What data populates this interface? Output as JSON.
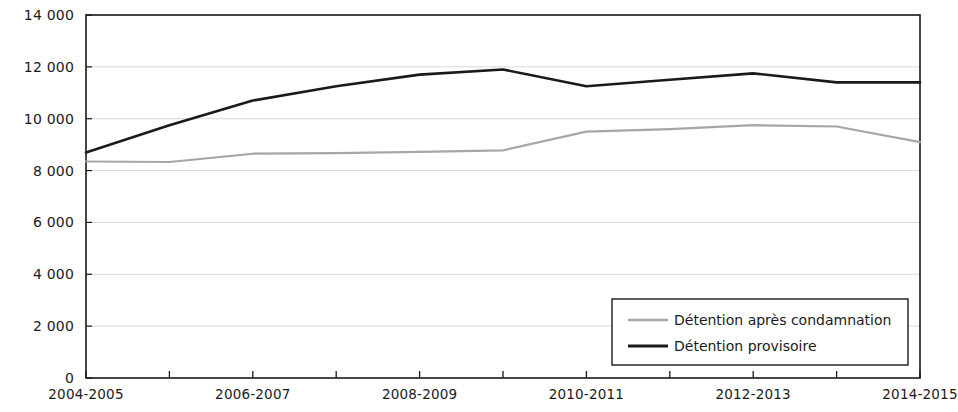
{
  "chart_data": {
    "type": "line",
    "title": "",
    "subtitle": "",
    "xlabel": "",
    "ylabel": "",
    "x": [
      "2004-2005",
      "2005-2006",
      "2006-2007",
      "2007-2008",
      "2008-2009",
      "2009-2010",
      "2010-2011",
      "2011-2012",
      "2012-2013",
      "2013-2014",
      "2014-2015"
    ],
    "categories": [
      "2004-2005",
      "2005-2006",
      "2006-2007",
      "2007-2008",
      "2008-2009",
      "2009-2010",
      "2010-2011",
      "2011-2012",
      "2012-2013",
      "2013-2014",
      "2014-2015"
    ],
    "series": [
      {
        "name": "Détention après condamnation",
        "color": "#a6a6a6",
        "values": [
          8350,
          8330,
          8650,
          8670,
          8720,
          8780,
          9500,
          9600,
          9750,
          9700,
          9100
        ]
      },
      {
        "name": "Détention provisoire",
        "color": "#1a1a1a",
        "values": [
          8700,
          9750,
          10700,
          11250,
          11700,
          11900,
          11250,
          11500,
          11750,
          11400,
          11400
        ]
      }
    ],
    "ylim": [
      0,
      14000
    ],
    "ytick_values": [
      0,
      2000,
      4000,
      6000,
      8000,
      10000,
      12000,
      14000
    ],
    "ytick_labels": [
      "0",
      "2 000",
      "4 000",
      "6 000",
      "8 000",
      "10 000",
      "12 000",
      "14 000"
    ],
    "xtick_labels_visible": [
      "2004-2005",
      "2006-2007",
      "2008-2009",
      "2010-2011",
      "2012-2013",
      "2014-2015"
    ],
    "xtick_label_indices": [
      0,
      2,
      4,
      6,
      8,
      10
    ],
    "grid": true,
    "grid_axis": "y",
    "legend_position": "bottom-right",
    "legend_entries": [
      {
        "label": "Détention après condamnation",
        "color": "#a6a6a6"
      },
      {
        "label": "Détention provisoire",
        "color": "#1a1a1a"
      }
    ]
  },
  "colors": {
    "axis": "#1a1a1a",
    "grid": "#d9d9d9",
    "plot_background": "#ffffff",
    "series_light": "#a6a6a6",
    "series_dark": "#1a1a1a"
  }
}
